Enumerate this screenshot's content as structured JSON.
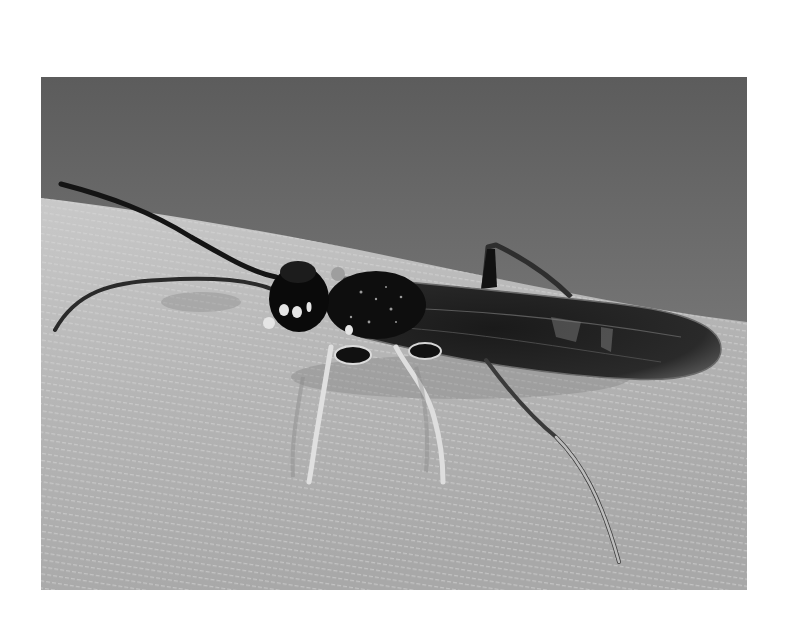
{
  "image": {
    "alt": "Grayscale photograph of a dark parasitoid wasp with long antennae and pale legs resting on a textured leaf",
    "subject": "wasp",
    "surface": "leaf",
    "colors": {
      "margin": "#ffffff",
      "sky_top": "#6e6e6e",
      "sky_bottom": "#8c8c8c",
      "leaf_light": "#c4c4c4",
      "leaf_dark": "#9a9a9a",
      "insect_body": "#111111",
      "leg": "#d8d8d8"
    }
  }
}
